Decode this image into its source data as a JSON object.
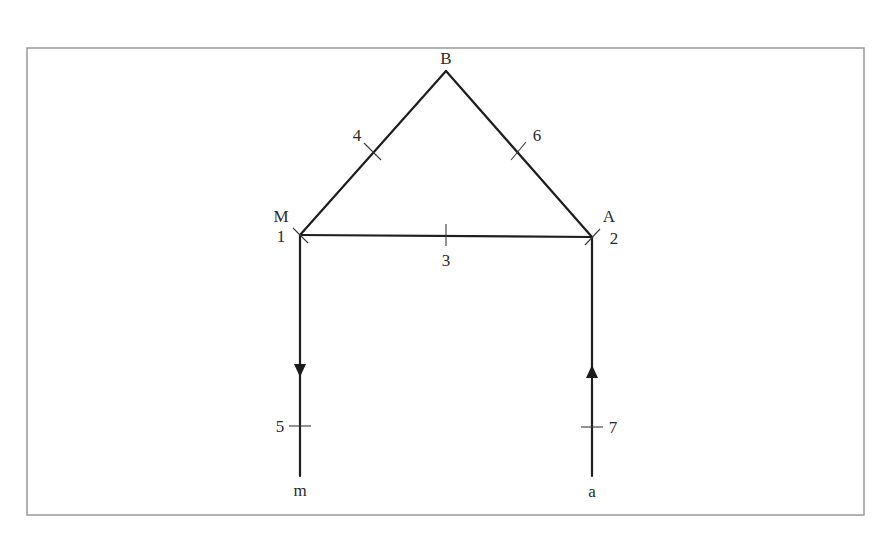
{
  "diagram": {
    "vertices": {
      "B": {
        "label": "B",
        "x": 446,
        "y": 71
      },
      "M": {
        "label": "M",
        "x": 300,
        "y": 235
      },
      "A": {
        "label": "A",
        "x": 592,
        "y": 237
      },
      "m": {
        "label": "m",
        "x": 300,
        "y": 476
      },
      "a": {
        "label": "a",
        "x": 592,
        "y": 476
      }
    },
    "edges": [
      {
        "id": "4",
        "label": "4",
        "from": "M",
        "to": "B"
      },
      {
        "id": "6",
        "label": "6",
        "from": "B",
        "to": "A"
      },
      {
        "id": "3",
        "label": "3",
        "from": "M",
        "to": "A"
      },
      {
        "id": "5",
        "label": "5",
        "from": "M",
        "to": "m",
        "arrow": "down"
      },
      {
        "id": "7",
        "label": "7",
        "from": "a",
        "to": "A",
        "arrow": "up"
      }
    ],
    "node_numbers": {
      "M": "1",
      "A": "2"
    },
    "colors": {
      "line": "#1e1e1e",
      "frame": "#8a8a8a",
      "text": "#2a2a2a",
      "background": "#ffffff"
    }
  }
}
